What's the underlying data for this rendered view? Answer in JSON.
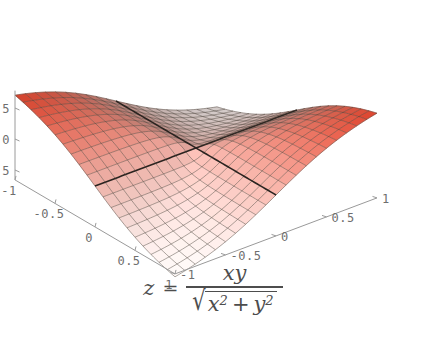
{
  "figure": {
    "name": "surface-plot-xy-over-sqrt-x2-y2",
    "background_color": "#ffffff"
  },
  "caption": {
    "lhs_variable": "z",
    "equals": "=",
    "numerator": "xy",
    "radical_sign": "√",
    "den_x": "x",
    "den_x_exp": "2",
    "den_plus": "+",
    "den_y": "y",
    "den_y_exp": "2",
    "plain_text": "z = xy / sqrt(x^2 + y^2)"
  },
  "axes": {
    "x": {
      "label": "x",
      "ticks": [
        "-1",
        "-0.5",
        "0",
        "0.5",
        "1"
      ],
      "tick_values": [
        -1,
        -0.5,
        0,
        0.5,
        1
      ],
      "range": [
        -1,
        1
      ]
    },
    "y": {
      "label": "y",
      "ticks": [
        "1",
        "0.5",
        "0",
        "-0.5",
        "-1"
      ],
      "tick_values": [
        1,
        0.5,
        0,
        -0.5,
        -1
      ],
      "range": [
        -1,
        1
      ]
    },
    "z": {
      "label": "z",
      "ticks": [
        "0.5",
        "0",
        "-0.5"
      ],
      "tick_values": [
        0.5,
        0,
        -0.5
      ],
      "range": [
        -0.72,
        0.72
      ]
    }
  },
  "colors": {
    "axis_line": "#9a9a9a",
    "tick_text": "#6e6e6e",
    "mesh_line": "#4a4038",
    "mesh_major": "#2b2420",
    "surface_high": "#e8462e",
    "surface_mid": "#f0a595",
    "surface_low": "#fdf4f2",
    "caption_text": "#4d4d4d"
  },
  "chart_data": {
    "type": "surface",
    "title": "",
    "expression": "z = x*y / sqrt(x^2 + y^2)",
    "xlabel": "x",
    "ylabel": "y",
    "zlabel": "z",
    "xlim": [
      -1,
      1
    ],
    "ylim": [
      -1,
      1
    ],
    "zlim": [
      -0.7071,
      0.7071
    ],
    "grid": true,
    "legend": false,
    "mesh_divisions": 20,
    "colormap": {
      "name": "red-to-white",
      "low": "#fdf4f2",
      "high": "#e8462e",
      "mapped_to": "z"
    },
    "projection": {
      "type": "oblique-parallel",
      "view_point": [
        1.3,
        -2.4,
        2.0
      ]
    },
    "corner_values": [
      {
        "x": -1,
        "y": -1,
        "z": 0.7071
      },
      {
        "x": -1,
        "y": 1,
        "z": -0.7071
      },
      {
        "x": 1,
        "y": -1,
        "z": -0.7071
      },
      {
        "x": 1,
        "y": 1,
        "z": 0.7071
      },
      {
        "x": 0,
        "y": 0,
        "z": 0
      }
    ],
    "sample_grid_note": "z evaluated on 21x21 grid over [-1,1]^2; z=0 along x=0 and y=0"
  }
}
